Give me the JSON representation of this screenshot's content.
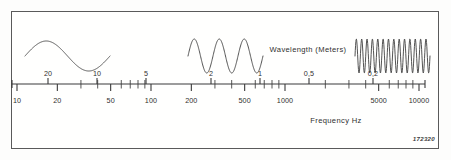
{
  "figure": {
    "plate_number": "172320",
    "frame_color": "#5a5a5a",
    "ink_color": "#2f2f2f",
    "background_color": "#fffffe"
  },
  "chart_data": {
    "type": "line",
    "title": "",
    "subtitle": "",
    "xlabel": "Frequency Hz",
    "top_axis_label": "Wavelength (Meters)",
    "grid": false,
    "legend_position": "none",
    "x_scale": "log",
    "xlim": [
      10,
      10000
    ],
    "frequency_axis": {
      "label": "Frequency Hz",
      "unit": "Hz",
      "scale": "log",
      "labeled_ticks": [
        {
          "value": 10,
          "text": "10",
          "x": 17
        },
        {
          "value": 20,
          "text": "20",
          "x": 57
        },
        {
          "value": 50,
          "text": "50",
          "x": 111
        },
        {
          "value": 100,
          "text": "100",
          "x": 151
        },
        {
          "value": 200,
          "text": "200",
          "x": 192
        },
        {
          "value": 500,
          "text": "500",
          "x": 245
        },
        {
          "value": 1000,
          "text": "1000",
          "x": 285
        },
        {
          "value": 5000,
          "text": "5000",
          "x": 379
        },
        {
          "value": 10000,
          "text": "10000",
          "x": 419
        }
      ],
      "minor_ticks": [
        30,
        40,
        60,
        70,
        80,
        90,
        300,
        400,
        600,
        700,
        800,
        900,
        2000,
        3000,
        4000,
        6000,
        7000,
        8000,
        9000
      ]
    },
    "wavelength_axis": {
      "label": "Wavelength (Meters)",
      "unit": "Meters",
      "scale": "log",
      "labeled_ticks": [
        {
          "value": 20,
          "text": "20",
          "x": 48
        },
        {
          "value": 10,
          "text": "10",
          "x": 97
        },
        {
          "value": 5,
          "text": "5",
          "x": 146
        },
        {
          "value": 2,
          "text": "2",
          "x": 211
        },
        {
          "value": 1,
          "text": "1",
          "x": 260
        },
        {
          "value": 0.5,
          "text": "0,5",
          "x": 309
        },
        {
          "value": 0.2,
          "text": "0,2",
          "x": 373
        },
        {
          "value": 0.1,
          "text": "0,1",
          "x": 422
        },
        {
          "value": 0.05,
          "text": "0,05",
          "x": 471
        }
      ]
    },
    "waveforms": [
      {
        "name": "low-frequency-wave",
        "cycles": 1,
        "center_frequency_hz": 30,
        "x_start": 25,
        "x_end": 110,
        "amplitude_px": 15,
        "description": "single long-wavelength sine cycle"
      },
      {
        "name": "mid-frequency-wave",
        "cycles": 3,
        "center_frequency_hz": 350,
        "x_start": 188,
        "x_end": 263,
        "amplitude_px": 17,
        "description": "three sine cycles, mid band"
      },
      {
        "name": "high-frequency-wave",
        "cycles": 14,
        "center_frequency_hz": 6000,
        "x_start": 355,
        "x_end": 430,
        "amplitude_px": 17,
        "description": "dense high-frequency sine train"
      }
    ]
  }
}
